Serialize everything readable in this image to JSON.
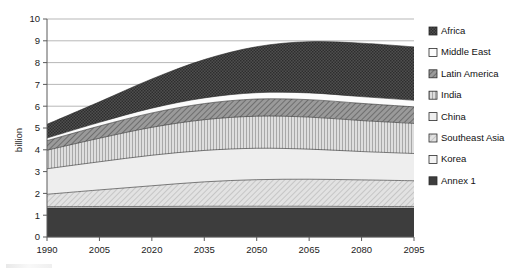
{
  "chart_data": {
    "type": "area",
    "stacked": true,
    "title": "",
    "subtitle": "",
    "xlabel": "",
    "ylabel": "billion",
    "x": [
      1990,
      2005,
      2020,
      2035,
      2050,
      2065,
      2080,
      2095
    ],
    "xtick_labels": [
      "1990",
      "2005",
      "2020",
      "2035",
      "2050",
      "2065",
      "2080",
      "2095"
    ],
    "ytick_labels": [
      "0",
      "1",
      "2",
      "3",
      "4",
      "5",
      "6",
      "7",
      "8",
      "9",
      "10"
    ],
    "ylim": [
      0,
      10
    ],
    "ytick_step": 1,
    "grid": "horizontal",
    "legend_position": "right",
    "stack_order_bottom_to_top": [
      "Annex 1",
      "Korea",
      "Southeast Asia",
      "China",
      "India",
      "Latin America",
      "Middle East",
      "Africa"
    ],
    "series": [
      {
        "name": "Annex 1",
        "values": [
          1.33,
          1.33,
          1.33,
          1.33,
          1.33,
          1.33,
          1.33,
          1.33
        ]
      },
      {
        "name": "Korea",
        "values": [
          0.06,
          0.07,
          0.07,
          0.08,
          0.08,
          0.08,
          0.07,
          0.07
        ]
      },
      {
        "name": "Southeast Asia",
        "values": [
          0.57,
          0.76,
          0.95,
          1.12,
          1.22,
          1.24,
          1.22,
          1.18
        ]
      },
      {
        "name": "China",
        "values": [
          1.17,
          1.29,
          1.4,
          1.44,
          1.44,
          1.38,
          1.3,
          1.25
        ]
      },
      {
        "name": "India",
        "values": [
          0.85,
          1.08,
          1.28,
          1.41,
          1.47,
          1.47,
          1.42,
          1.38
        ]
      },
      {
        "name": "Latin America",
        "values": [
          0.44,
          0.56,
          0.66,
          0.74,
          0.79,
          0.8,
          0.79,
          0.76
        ]
      },
      {
        "name": "Middle East",
        "values": [
          0.12,
          0.17,
          0.22,
          0.26,
          0.29,
          0.31,
          0.31,
          0.3
        ]
      },
      {
        "name": "Africa",
        "values": [
          0.63,
          0.94,
          1.34,
          1.76,
          2.11,
          2.35,
          2.45,
          2.45
        ]
      }
    ],
    "cumulative_totals": [
      5.17,
      6.2,
      7.25,
      8.14,
      8.73,
      8.96,
      8.89,
      8.72
    ],
    "cumulative_boundaries_bottom_to_top": {
      "Annex 1": [
        1.33,
        1.33,
        1.33,
        1.33,
        1.33,
        1.33,
        1.33,
        1.33
      ],
      "Korea": [
        1.39,
        1.4,
        1.4,
        1.41,
        1.41,
        1.41,
        1.4,
        1.4
      ],
      "Southeast Asia": [
        1.96,
        2.16,
        2.35,
        2.53,
        2.63,
        2.65,
        2.62,
        2.58
      ],
      "China": [
        3.13,
        3.45,
        3.75,
        3.97,
        4.07,
        4.03,
        3.92,
        3.83
      ],
      "India": [
        3.98,
        4.53,
        5.03,
        5.38,
        5.54,
        5.5,
        5.34,
        5.21
      ],
      "Latin America": [
        4.42,
        5.09,
        5.69,
        6.12,
        6.33,
        6.3,
        6.13,
        5.97
      ],
      "Middle East": [
        4.54,
        5.26,
        5.91,
        6.38,
        6.62,
        6.61,
        6.44,
        6.27
      ],
      "Africa": [
        5.17,
        6.2,
        7.25,
        8.14,
        8.73,
        8.96,
        8.89,
        8.72
      ]
    }
  },
  "axes": {
    "y_title": "billion",
    "y_ticks": [
      "10",
      "9",
      "8",
      "7",
      "6",
      "5",
      "4",
      "3",
      "2",
      "1",
      "0"
    ],
    "x_ticks": [
      "1990",
      "2005",
      "2020",
      "2035",
      "2050",
      "2065",
      "2080",
      "2095"
    ]
  },
  "legend": {
    "items": [
      {
        "label": "Africa",
        "swatch": "dark-checker-swatch"
      },
      {
        "label": "Middle East",
        "swatch": "white-swatch"
      },
      {
        "label": "Latin America",
        "swatch": "mid-diagonal-swatch"
      },
      {
        "label": "India",
        "swatch": "vertical-stripe-swatch"
      },
      {
        "label": "China",
        "swatch": "light-swatch"
      },
      {
        "label": "Southeast Asia",
        "swatch": "fine-diagonal-swatch"
      },
      {
        "label": "Korea",
        "swatch": "pale-swatch"
      },
      {
        "label": "Annex 1",
        "swatch": "solid-dark-swatch"
      }
    ]
  },
  "colors": {
    "africa": "#4a4a4a",
    "middle_east": "#fbfbfb",
    "latin_america": "#8e8e8e",
    "india": "#c6c6c6",
    "china": "#ececec",
    "southeast_asia": "#dadada",
    "korea": "#f2f2f2",
    "annex_1": "#3d3d3d",
    "grid": "#9a9a9a",
    "axis": "#5a5a5a",
    "text": "#1a1a1a",
    "background": "#ffffff"
  }
}
